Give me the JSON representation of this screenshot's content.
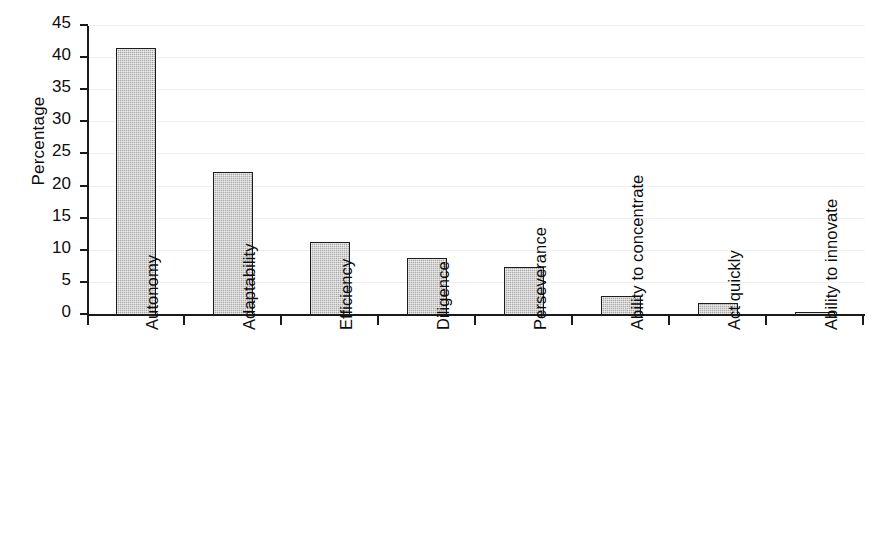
{
  "chart_data": {
    "type": "bar",
    "title": "",
    "subtitle": "",
    "xlabel": "",
    "ylabel": "Percentage",
    "ylim": [
      0,
      45
    ],
    "ytick_values": [
      0,
      5,
      10,
      15,
      20,
      25,
      30,
      35,
      40,
      45
    ],
    "ytick_labels": [
      "0",
      "5",
      "10",
      "15",
      "20",
      "25",
      "30",
      "35",
      "40",
      "45"
    ],
    "grid": true,
    "grid_axis": "y",
    "legend": false,
    "legend_position": "none",
    "categories": [
      "Autonomy",
      "Adaptability",
      "Efficiency",
      "Diligence",
      "Perseverance",
      "Ability to concentrate",
      "Act quickly",
      "Ability to innovate"
    ],
    "values": [
      41.5,
      22.2,
      11.3,
      8.9,
      7.4,
      2.9,
      1.9,
      0.5
    ],
    "bar_color": "#a8a8a8",
    "bar_edge_color": "#1c1c1c",
    "axis_color": "#1a1a1a",
    "gridline_color": "#f0f0f0",
    "background_color": "#ffffff"
  }
}
